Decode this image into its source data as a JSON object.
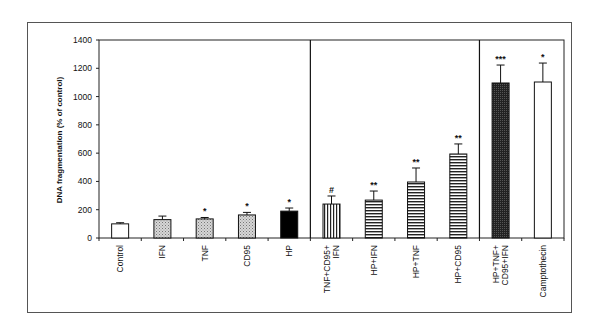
{
  "chart_data": {
    "type": "bar",
    "title": "",
    "xlabel": "",
    "ylabel": "DNA fragmentation (% of control)",
    "ylim": [
      0,
      1400
    ],
    "yticks": [
      0,
      200,
      400,
      600,
      800,
      1000,
      1200,
      1400
    ],
    "grid": false,
    "legend": null,
    "categories": [
      "Control",
      "IFN",
      "TNF",
      "CD95",
      "HP",
      "TNF+CD95+ IFN",
      "HP+IFN",
      "HP+TNF",
      "HP+CD95",
      "HP+TNF+ CD95+IFN",
      "Camptothecin"
    ],
    "category_lines": [
      [
        "Control"
      ],
      [
        "IFN"
      ],
      [
        "TNF"
      ],
      [
        "CD95"
      ],
      [
        "HP"
      ],
      [
        "TNF+CD95+",
        "IFN"
      ],
      [
        "HP+IFN"
      ],
      [
        "HP+TNF"
      ],
      [
        "HP+CD95"
      ],
      [
        "HP+TNF+",
        "CD95+IFN"
      ],
      [
        "Camptothecin"
      ]
    ],
    "values": [
      100,
      130,
      135,
      163,
      190,
      240,
      268,
      396,
      594,
      1096,
      1103
    ],
    "errors": [
      8,
      25,
      10,
      18,
      22,
      57,
      64,
      99,
      71,
      127,
      134
    ],
    "annotations": [
      "",
      "",
      "*",
      "*",
      "*",
      "#",
      "**",
      "**",
      "**",
      "***",
      "*"
    ],
    "fills": [
      "white",
      "dots",
      "dots",
      "dots",
      "black",
      "vstripes",
      "hstripes",
      "hstripes",
      "hstripes",
      "darkcheck",
      "white"
    ],
    "group_dividers_after": [
      4,
      8
    ]
  }
}
